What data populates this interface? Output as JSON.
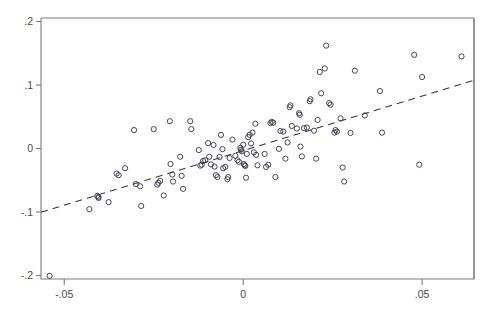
{
  "figure": {
    "background_color": "#ffffff",
    "frame_color": "#7d7d7a",
    "marker_color": "#3c3c50",
    "fitline_color": "#3a3a3a"
  },
  "chart_data": {
    "type": "scatter",
    "title": "",
    "subtitle": "",
    "xlabel": "",
    "ylabel": "",
    "xlim": [
      -0.0565,
      0.0645
    ],
    "ylim": [
      -0.2055,
      0.2055
    ],
    "xticks": [
      -0.05,
      0,
      0.05
    ],
    "xticklabels": [
      "-.05",
      "0",
      ".05"
    ],
    "yticks": [
      0.2,
      0.1,
      0,
      -0.1,
      -0.2
    ],
    "yticklabels": [
      ".2",
      ".1",
      "0",
      "-.1",
      "-.2"
    ],
    "grid": false,
    "legend": null,
    "annotations": [],
    "marker_style": "open-circle",
    "marker_radius_px": 2.6,
    "series": [
      {
        "name": "observations",
        "points": [
          [
            -0.0541,
            -0.2005
          ],
          [
            -0.043,
            -0.0955
          ],
          [
            -0.0408,
            -0.0745
          ],
          [
            -0.0404,
            -0.078
          ],
          [
            -0.0405,
            -0.0762
          ],
          [
            -0.0376,
            -0.0845
          ],
          [
            -0.0354,
            -0.0395
          ],
          [
            -0.0348,
            -0.042
          ],
          [
            -0.033,
            -0.031
          ],
          [
            -0.0305,
            0.029
          ],
          [
            -0.03,
            -0.056
          ],
          [
            -0.0288,
            -0.0595
          ],
          [
            -0.0285,
            -0.0905
          ],
          [
            -0.025,
            0.0305
          ],
          [
            -0.024,
            -0.057
          ],
          [
            -0.0237,
            -0.054
          ],
          [
            -0.0232,
            -0.051
          ],
          [
            -0.0222,
            -0.074
          ],
          [
            -0.0205,
            0.043
          ],
          [
            -0.0203,
            -0.0245
          ],
          [
            -0.0198,
            -0.041
          ],
          [
            -0.0196,
            -0.052
          ],
          [
            -0.0176,
            -0.013
          ],
          [
            -0.0172,
            -0.043
          ],
          [
            -0.0168,
            -0.0635
          ],
          [
            -0.0148,
            0.043
          ],
          [
            -0.0145,
            0.0305
          ],
          [
            -0.0124,
            -0.0025
          ],
          [
            -0.012,
            -0.027
          ],
          [
            -0.0116,
            -0.0255
          ],
          [
            -0.0112,
            -0.0195
          ],
          [
            -0.0106,
            -0.0185
          ],
          [
            -0.0098,
            0.0085
          ],
          [
            -0.0095,
            -0.013
          ],
          [
            -0.009,
            -0.025
          ],
          [
            -0.0083,
            0.0055
          ],
          [
            -0.008,
            -0.0285
          ],
          [
            -0.0076,
            -0.042
          ],
          [
            -0.0072,
            -0.045
          ],
          [
            -0.0066,
            -0.0135
          ],
          [
            -0.0062,
            0.0215
          ],
          [
            -0.0058,
            -0.001
          ],
          [
            -0.0056,
            -0.031
          ],
          [
            -0.005,
            -0.029
          ],
          [
            -0.0044,
            -0.0485
          ],
          [
            -0.0042,
            -0.045
          ],
          [
            -0.0038,
            -0.015
          ],
          [
            -0.003,
            0.014
          ],
          [
            -0.0022,
            -0.0115
          ],
          [
            -0.0016,
            -0.0185
          ],
          [
            -0.0012,
            -0.021
          ],
          [
            -0.0008,
            0.001
          ],
          [
            -0.0006,
            -0.002
          ],
          [
            -0.0004,
            -0.0045
          ],
          [
            0.0,
            0.006
          ],
          [
            0.0002,
            -0.0245
          ],
          [
            0.0004,
            -0.0265
          ],
          [
            0.0006,
            -0.0275
          ],
          [
            0.0008,
            -0.046
          ],
          [
            0.001,
            -0.0085
          ],
          [
            0.0014,
            0.018
          ],
          [
            0.0018,
            0.0215
          ],
          [
            0.0022,
            0.008
          ],
          [
            0.0026,
            0.025
          ],
          [
            0.003,
            -0.006
          ],
          [
            0.0034,
            0.039
          ],
          [
            0.0036,
            -0.01
          ],
          [
            0.004,
            -0.0265
          ],
          [
            0.006,
            -0.0085
          ],
          [
            0.0064,
            -0.029
          ],
          [
            0.007,
            -0.0255
          ],
          [
            0.0076,
            0.04
          ],
          [
            0.008,
            0.042
          ],
          [
            0.0084,
            0.0405
          ],
          [
            0.009,
            -0.045
          ],
          [
            0.01,
            -0.0005
          ],
          [
            0.0104,
            0.0275
          ],
          [
            0.0112,
            0.0265
          ],
          [
            0.0118,
            -0.016
          ],
          [
            0.0124,
            0.0095
          ],
          [
            0.013,
            0.065
          ],
          [
            0.0132,
            0.068
          ],
          [
            0.0136,
            0.0355
          ],
          [
            0.015,
            0.0315
          ],
          [
            0.0156,
            0.0555
          ],
          [
            0.0158,
            0.053
          ],
          [
            0.016,
            0.003
          ],
          [
            0.0164,
            -0.0125
          ],
          [
            0.017,
            0.032
          ],
          [
            0.0178,
            0.033
          ],
          [
            0.0186,
            0.0745
          ],
          [
            0.0188,
            0.0775
          ],
          [
            0.0198,
            0.028
          ],
          [
            0.0204,
            -0.016
          ],
          [
            0.0208,
            0.045
          ],
          [
            0.0214,
            0.1205
          ],
          [
            0.0218,
            0.087
          ],
          [
            0.0228,
            0.126
          ],
          [
            0.0232,
            0.162
          ],
          [
            0.024,
            0.0715
          ],
          [
            0.0244,
            0.069
          ],
          [
            0.0255,
            0.025
          ],
          [
            0.0258,
            0.029
          ],
          [
            0.0262,
            0.0265
          ],
          [
            0.0272,
            0.0475
          ],
          [
            0.0278,
            -0.03
          ],
          [
            0.0282,
            -0.052
          ],
          [
            0.03,
            0.0245
          ],
          [
            0.0312,
            0.1225
          ],
          [
            0.034,
            0.052
          ],
          [
            0.0382,
            0.0905
          ],
          [
            0.0388,
            0.025
          ],
          [
            0.0478,
            0.1475
          ],
          [
            0.0492,
            -0.0255
          ],
          [
            0.05,
            0.1125
          ],
          [
            0.061,
            0.145
          ]
        ]
      }
    ],
    "fit_line": {
      "type": "linear-fit",
      "style": "dashed",
      "x_start": -0.0565,
      "y_start": -0.1005,
      "x_end": 0.0645,
      "y_end": 0.1075,
      "slope": 1.719,
      "intercept": -0.0034
    }
  }
}
